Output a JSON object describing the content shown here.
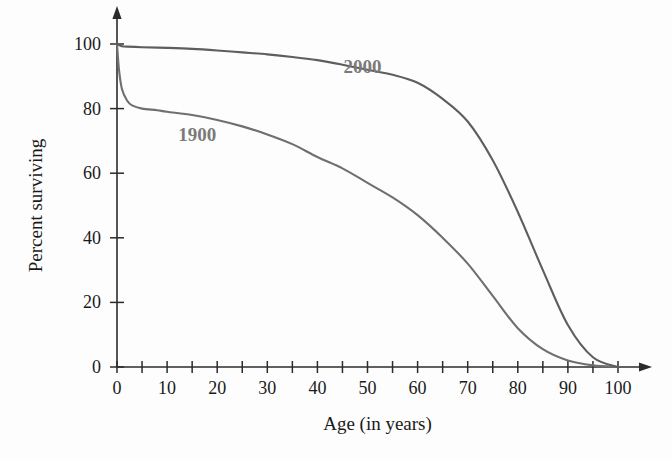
{
  "figure": {
    "background_color": "#fdfdfd",
    "axis_color": "#2b2b2b",
    "text_color": "#1a1a1a"
  },
  "chart_data": {
    "type": "line",
    "title": "",
    "xlabel": "Age (in years)",
    "ylabel": "Percent surviving",
    "xlim": [
      0,
      100
    ],
    "ylim": [
      0,
      105
    ],
    "grid": false,
    "legend_position": "inline-annotation",
    "x_tick_labels": [
      "0",
      "10",
      "20",
      "30",
      "40",
      "50",
      "60",
      "70",
      "80",
      "90",
      "100"
    ],
    "x_tick_values": [
      0,
      10,
      20,
      30,
      40,
      50,
      60,
      70,
      80,
      90,
      100
    ],
    "x_minor_tick_values": [
      5,
      15,
      25,
      35,
      45,
      55,
      65,
      75,
      85,
      95
    ],
    "y_tick_labels": [
      "0",
      "20",
      "40",
      "60",
      "80",
      "100"
    ],
    "y_tick_values": [
      0,
      20,
      40,
      60,
      80,
      100
    ],
    "series": [
      {
        "name": "1900",
        "color": "#6f6f6f",
        "label_x": 16,
        "label_y": 70,
        "x": [
          0,
          0.4,
          1,
          2,
          3,
          5,
          8,
          10,
          15,
          20,
          25,
          30,
          35,
          40,
          45,
          50,
          55,
          60,
          65,
          70,
          75,
          80,
          85,
          90,
          95,
          100
        ],
        "values": [
          100,
          92,
          86,
          82.5,
          81,
          80,
          79.5,
          79,
          78,
          76.5,
          74.5,
          72,
          69,
          65,
          61.5,
          57,
          52.5,
          47,
          40,
          32,
          22,
          12,
          5.5,
          2,
          0.5,
          0
        ]
      },
      {
        "name": "2000",
        "color": "#5e5e5e",
        "label_x": 49,
        "label_y": 91,
        "x": [
          0,
          1,
          2,
          5,
          10,
          15,
          20,
          25,
          30,
          35,
          40,
          45,
          50,
          55,
          60,
          65,
          70,
          75,
          80,
          85,
          90,
          95,
          100
        ],
        "values": [
          100,
          99.3,
          99.2,
          99,
          98.8,
          98.5,
          98,
          97.4,
          96.8,
          96,
          95,
          93.6,
          92,
          90.5,
          88,
          83,
          76,
          64,
          48,
          30,
          13,
          3,
          0
        ]
      }
    ]
  },
  "annotations": {
    "series_labels": [
      {
        "text": "1900"
      },
      {
        "text": "2000"
      }
    ]
  }
}
